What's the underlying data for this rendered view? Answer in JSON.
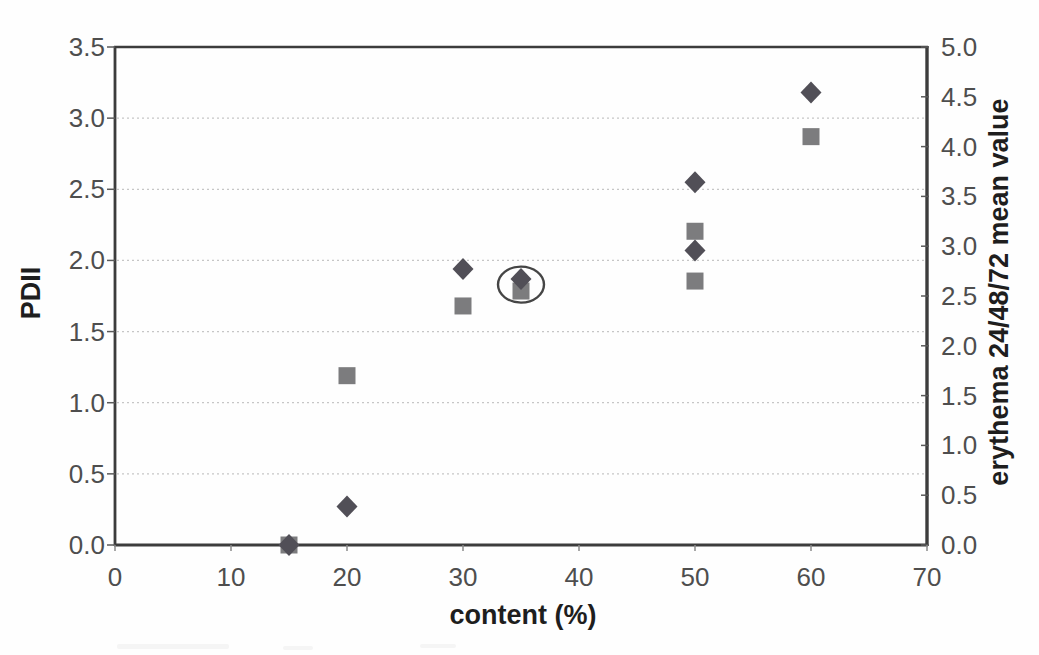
{
  "figure": {
    "background_color": "#fefefe",
    "frame_color": "#3c3c3c",
    "tick_color": "#5a5a5a",
    "tick_label_color": "#4e4e4e",
    "axis_title_color": "#1e1e1e",
    "gridline_color": "#c6c6c6"
  },
  "chart_data": {
    "type": "scatter",
    "title": "",
    "xlabel": "content (%)",
    "ylabel_left": "PDII",
    "ylabel_right": "erythema 24/48/72 mean value",
    "xlim": [
      0,
      70
    ],
    "ylim_left": [
      0,
      3.5
    ],
    "ylim_right": [
      0,
      5.0
    ],
    "x_ticks": [
      0,
      10,
      20,
      30,
      40,
      50,
      60,
      70
    ],
    "y_ticks_left": [
      0.0,
      0.5,
      1.0,
      1.5,
      2.0,
      2.5,
      3.0,
      3.5
    ],
    "y_ticks_right": [
      0.0,
      0.5,
      1.0,
      1.5,
      2.0,
      2.5,
      3.0,
      3.5,
      4.0,
      4.5,
      5.0
    ],
    "grid": {
      "horizontal": true,
      "style": "dotted",
      "at_left_axis_values": [
        0.5,
        1.0,
        1.5,
        2.0,
        2.5,
        3.0
      ]
    },
    "legend": "none",
    "series": [
      {
        "name": "erythema 24/48/72 mean value",
        "marker": "square",
        "axis": "right",
        "color": "#7c7c7e",
        "points": [
          {
            "x": 15,
            "y": 0.0
          },
          {
            "x": 20,
            "y": 1.7
          },
          {
            "x": 30,
            "y": 2.4
          },
          {
            "x": 35,
            "y": 2.55
          },
          {
            "x": 50,
            "y": 3.15
          },
          {
            "x": 50,
            "y": 2.65
          },
          {
            "x": 60,
            "y": 4.1
          }
        ]
      },
      {
        "name": "PDII",
        "marker": "diamond",
        "axis": "left",
        "color": "#514f57",
        "points": [
          {
            "x": 15,
            "y": 0.0
          },
          {
            "x": 20,
            "y": 0.27
          },
          {
            "x": 30,
            "y": 1.94
          },
          {
            "x": 35,
            "y": 1.87
          },
          {
            "x": 50,
            "y": 2.55
          },
          {
            "x": 50,
            "y": 2.07
          },
          {
            "x": 60,
            "y": 3.18
          }
        ]
      }
    ],
    "annotation": {
      "type": "ellipse-highlight",
      "x_value": 35,
      "y_left_value": 1.83,
      "color": "#454545",
      "meaning": "circled overlapping diamond and square data points at content 35%"
    }
  }
}
